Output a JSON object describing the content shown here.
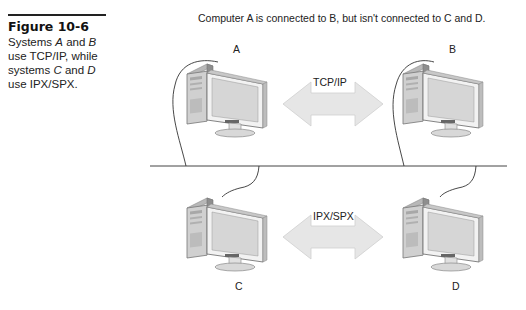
{
  "figure": {
    "number": "Figure 10-6",
    "caption_parts": [
      {
        "text": "Systems ",
        "italic": false
      },
      {
        "text": "A",
        "italic": true
      },
      {
        "text": " and ",
        "italic": false
      },
      {
        "text": "B",
        "italic": true
      },
      {
        "text": " use TCP/IP, while systems ",
        "italic": false
      },
      {
        "text": "C",
        "italic": true
      },
      {
        "text": " and ",
        "italic": false
      },
      {
        "text": "D",
        "italic": true
      },
      {
        "text": " use IPX/SPX.",
        "italic": false
      }
    ]
  },
  "diagram": {
    "title": "Computer A is connected to B, but isn't connected to C and D.",
    "computers": [
      {
        "id": "A",
        "label": "A"
      },
      {
        "id": "B",
        "label": "B"
      },
      {
        "id": "C",
        "label": "C"
      },
      {
        "id": "D",
        "label": "D"
      }
    ],
    "links": [
      {
        "from": "A",
        "to": "B",
        "protocol": "TCP/IP"
      },
      {
        "from": "C",
        "to": "D",
        "protocol": "IPX/SPX"
      }
    ],
    "colors": {
      "arrow_fill": "#e6e6e6",
      "arrow_stroke": "#c8c8c8",
      "tower_front": "#d8d8d8",
      "tower_side": "#9a9a9a",
      "monitor_frame": "#eeeeee",
      "monitor_screen": "#d4d4d4",
      "line": "#333333"
    }
  }
}
